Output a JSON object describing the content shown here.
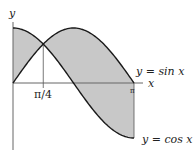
{
  "figure": {
    "axis_x_label": "x",
    "axis_y_label": "y",
    "tick_pi4": "π/4",
    "tick_pi": "π",
    "curve_sin_label": "y = sin x",
    "curve_cos_label": "y = cos x",
    "shade_color": "#c8c8c8",
    "curve_color": "#1a1a1a",
    "axis_color": "#666666"
  },
  "chart_data": {
    "type": "area",
    "title": "",
    "xlabel": "x",
    "ylabel": "y",
    "xlim": [
      0,
      3.14159
    ],
    "ylim": [
      -1,
      1
    ],
    "x_ticks": [
      {
        "value": 0.7854,
        "label": "π/4"
      },
      {
        "value": 3.14159,
        "label": "π"
      }
    ],
    "series": [
      {
        "name": "y = sin x",
        "function": "sin"
      },
      {
        "name": "y = cos x",
        "function": "cos"
      }
    ],
    "shaded_region": "between sin x and cos x on [0, π]",
    "intersection": {
      "x": 0.7854,
      "y": 0.7071
    },
    "grid": false,
    "legend": "none"
  }
}
